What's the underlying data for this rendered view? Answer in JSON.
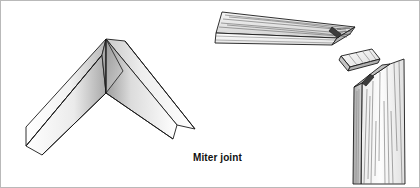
{
  "figure": {
    "caption": "Miter joint",
    "caption_color": "#111111",
    "background_color": "#ffffff",
    "border_color": "#b9b9b9",
    "line_color": "#1a1a1a",
    "grain_color": "#555555",
    "shade_light": "#ffffff",
    "shade_mid": "#d8d8d8",
    "shade_dark": "#8f8f8f",
    "shade_darkest": "#4a4a4a"
  },
  "panels": {
    "left": {
      "name": "assembled-miter-corner",
      "description": "Assembled V-shaped mitered corner seen in perspective",
      "apex": {
        "x": 105,
        "y": 38
      },
      "left_arm_tip": {
        "x": 25,
        "y": 145
      },
      "right_arm_tip": {
        "x": 194,
        "y": 128
      }
    },
    "right": {
      "name": "exploded-miter-assembly",
      "description": "Exploded view: horizontal board, loose spline key, vertical board",
      "parts": [
        {
          "name": "horizontal-board",
          "label": "horizontal mitered board"
        },
        {
          "name": "spline-key",
          "label": "loose spline key"
        },
        {
          "name": "vertical-board",
          "label": "vertical mitered board"
        }
      ]
    }
  }
}
